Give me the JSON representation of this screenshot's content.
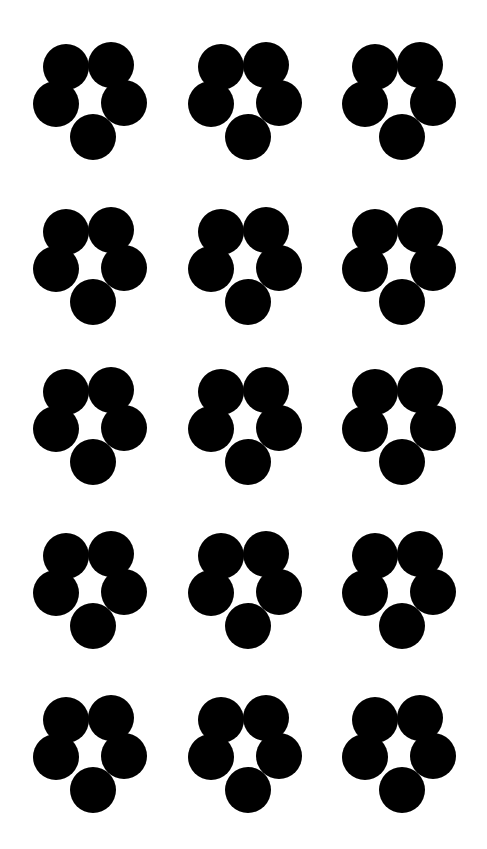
{
  "figure": {
    "rows": 5,
    "columns": 3,
    "shape_color": "#000000",
    "background_color": "#ffffff",
    "circles_per_shape": 5,
    "circle_radius": 23
  },
  "grid": {
    "col_x": [
      33,
      188,
      342
    ],
    "row_y": [
      42,
      207,
      367,
      531,
      695
    ]
  },
  "shape": {
    "name": "five-circle-flower",
    "circles": [
      {
        "id": "top-left",
        "cx": 33,
        "cy": 25
      },
      {
        "id": "top-right",
        "cx": 78,
        "cy": 23
      },
      {
        "id": "left",
        "cx": 23,
        "cy": 62
      },
      {
        "id": "right",
        "cx": 91,
        "cy": 61
      },
      {
        "id": "bottom",
        "cx": 60,
        "cy": 95
      }
    ]
  }
}
